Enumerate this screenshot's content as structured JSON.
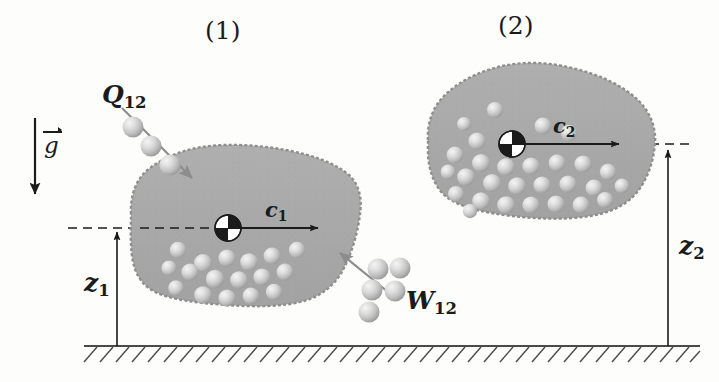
{
  "figure": {
    "background_color": "#fdfdfc",
    "ink_color": "#1b1b1b",
    "body_fill_color": "#a8a8a8",
    "body_edge_color": "#8e8e8e",
    "particle_color": "#cfcfcf"
  },
  "labels": {
    "state_1": "(1)",
    "state_2": "(2)",
    "gravity": {
      "symbol": "g",
      "accent": "vector-arrow"
    },
    "heat": {
      "symbol": "Q",
      "subscript": "12"
    },
    "work": {
      "symbol": "W",
      "subscript": "12"
    },
    "velocity_1": {
      "symbol": "c",
      "subscript": "1"
    },
    "velocity_2": {
      "symbol": "c",
      "subscript": "2"
    },
    "height_1": {
      "symbol": "z",
      "subscript": "1"
    },
    "height_2": {
      "symbol": "z",
      "subscript": "2"
    }
  },
  "geometry": {
    "ground_line_y": 346,
    "ground_x_start": 84,
    "ground_x_end": 700,
    "datum_1_y": 228,
    "datum_2_y": 144,
    "height_axis_1_x": 117,
    "height_axis_2_x": 668,
    "com_1": {
      "x": 228,
      "y": 228,
      "r": 13
    },
    "com_2": {
      "x": 512,
      "y": 144,
      "r": 13
    },
    "velocity_arrow_1": {
      "x1": 228,
      "y1": 228,
      "x2": 325,
      "y2": 228
    },
    "velocity_arrow_2": {
      "x1": 512,
      "y1": 144,
      "x2": 626,
      "y2": 144
    },
    "gravity_arrow": {
      "x1": 35,
      "y1": 118,
      "x2": 35,
      "y2": 201
    },
    "heat_arrow": {
      "x1": 124,
      "y1": 110,
      "x2": 196,
      "y2": 182
    },
    "work_arrow": {
      "x1": 388,
      "y1": 290,
      "x2": 333,
      "y2": 248
    }
  },
  "particle_groups": {
    "heat_stream_count": 3,
    "work_stream_count": 5,
    "body_1_particle_count": 17,
    "body_2_particle_count": 29
  }
}
